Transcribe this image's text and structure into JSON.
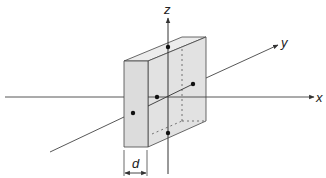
{
  "diagram": {
    "title": "",
    "labels": {
      "x_axis": "x",
      "y_axis": "y",
      "z_axis": "z",
      "thickness": "d"
    },
    "colors": {
      "slab_fill": "#e4e4e4",
      "slab_top": "#ececec",
      "slab_side": "#d8d8d8",
      "line": "#333333",
      "dot": "#111111",
      "background": "#ffffff"
    },
    "points": [
      {
        "name": "top-face-point",
        "x": 168,
        "y": 47
      },
      {
        "name": "back-face-point",
        "x": 193,
        "y": 84
      },
      {
        "name": "center-point",
        "x": 157,
        "y": 97
      },
      {
        "name": "front-face-point",
        "x": 133,
        "y": 113
      },
      {
        "name": "bottom-face-point",
        "x": 168,
        "y": 133
      }
    ]
  }
}
